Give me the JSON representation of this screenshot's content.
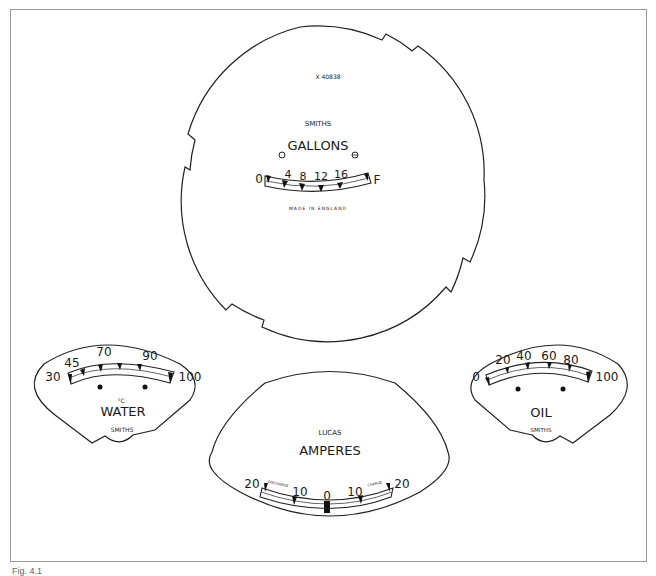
{
  "figure": {
    "caption": "Fig. 4.1",
    "background": "#ffffff",
    "line_color": "#1a1a1a"
  },
  "fuel_gauge": {
    "part_number": "X 40838",
    "maker": "SMITHS",
    "title": "GALLONS",
    "scale": [
      "0",
      "4",
      "8",
      "12",
      "16",
      "F"
    ],
    "footer": "MADE IN ENGLAND"
  },
  "water_gauge": {
    "unit": "°C",
    "title": "WATER",
    "maker": "SMITHS",
    "scale": [
      "30",
      "45",
      "70",
      "90",
      "100"
    ]
  },
  "ammeter": {
    "maker": "LUCAS",
    "title": "AMPERES",
    "scale": [
      "20",
      "10",
      "0",
      "10",
      "20"
    ],
    "left_label": "DISCHARGE",
    "right_label": "CHARGE"
  },
  "oil_gauge": {
    "title": "OIL",
    "maker": "SMITHS",
    "scale": [
      "0",
      "20",
      "40",
      "60",
      "80",
      "100"
    ]
  }
}
